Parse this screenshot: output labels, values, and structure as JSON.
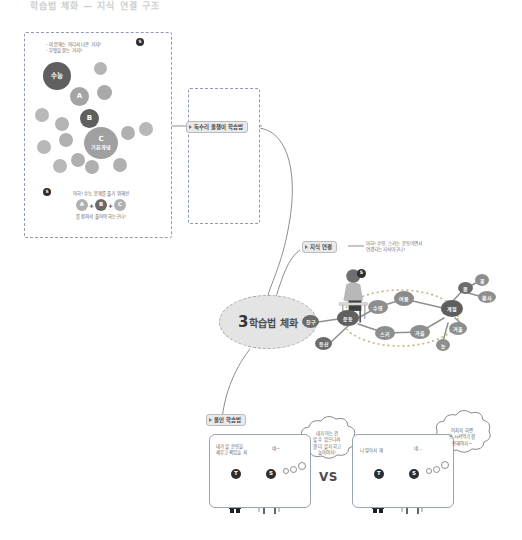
{
  "header": {
    "title": "학습법 체화 — 지식 연결 구조"
  },
  "panels": {
    "concept": {
      "name": "기본개념 마인드맵",
      "speech_top": "- 이 문제는 어디서 나온 거지?\n- 무엇을 묻는 거지?",
      "speech_bottom_top": "아하! 수능 문제를 풀기 위해선",
      "speech_bottom_formula": [
        "A",
        "B",
        "C"
      ],
      "speech_bottom_operator": "+",
      "speech_bottom_bottom": "를 합쳐서 풀어야 하는구나!",
      "nodes": [
        {
          "id": "suneung",
          "label": "수능",
          "tone": "dark"
        },
        {
          "id": "a",
          "label": "A",
          "tone": "mid"
        },
        {
          "id": "b",
          "label": "B",
          "tone": "dark"
        },
        {
          "id": "c",
          "label": "C",
          "sub": "기본개념",
          "tone": "mid"
        }
      ],
      "figure_top_badge": "S",
      "figure_bottom_badge": "S"
    },
    "eagle": {
      "label": "독수리 올챙이 학습법",
      "stages": [
        "eagle-icon",
        "up-arrow-icon",
        "caterpillar-icon",
        "up-arrow-icon",
        "ant-icon"
      ]
    },
    "connect": {
      "label": "지식 연결",
      "note": "아하! 수영, 스키는 운동이면서\n연결되는 지식이구나!",
      "figure_badge": "S",
      "network": {
        "nodes": [
          {
            "id": "chingu",
            "label": "친구",
            "tone": "dark"
          },
          {
            "id": "deungsan",
            "label": "등산",
            "tone": "dark"
          },
          {
            "id": "undong",
            "label": "운동",
            "tone": "dark"
          },
          {
            "id": "suyeong",
            "label": "수영",
            "tone": "mid"
          },
          {
            "id": "seuki",
            "label": "스키",
            "tone": "mid"
          },
          {
            "id": "yeoreum",
            "label": "여름",
            "tone": "mid"
          },
          {
            "id": "gyeoul",
            "label": "가을",
            "tone": "mid"
          },
          {
            "id": "gyejeol",
            "label": "계절",
            "tone": "dark"
          },
          {
            "id": "bom",
            "label": "봄",
            "tone": "dark"
          },
          {
            "id": "kkot",
            "label": "꽃",
            "tone": "mid"
          },
          {
            "id": "hwangsa",
            "label": "황사",
            "tone": "mid"
          },
          {
            "id": "gagyeol",
            "label": "겨울",
            "tone": "mid"
          },
          {
            "id": "nun",
            "label": "눈",
            "tone": "mid"
          }
        ]
      }
    },
    "allin": {
      "label": "올인 학습법",
      "vs": "VS",
      "scene_left": {
        "board_text": "내가 할 분량을\n세우고 책임을 져",
        "student_line": "네~",
        "thought": "내가 아는 건\n할 수 있으니까,\n뭘 더 할지 하고\n놀아야지!",
        "teacher_badge": "T",
        "student_badge": "S"
      },
      "scene_right": {
        "board_text": "니 알아서 해",
        "student_line": "네...",
        "thought": "어차피 하면\n또 시켜먹기 뭘\n안해야지~",
        "teacher_badge": "T",
        "student_badge": "S"
      }
    }
  },
  "colors": {
    "node_dark": "#6e6e6e",
    "node_mid": "#a0a0a0",
    "node_light": "#bcbcbc",
    "edge": "#9a9a9a",
    "panel_border": "#8f9bb3",
    "tag_bg": "#e9e9ea",
    "center_fill": "#e4e4e4"
  }
}
